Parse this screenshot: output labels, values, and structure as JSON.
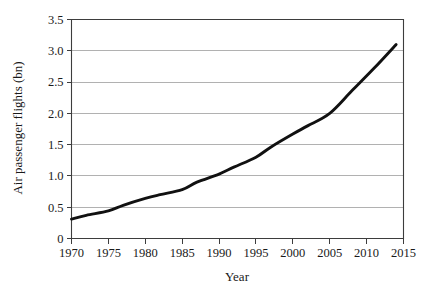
{
  "chart_data": {
    "type": "line",
    "title": "",
    "xlabel": "Year",
    "ylabel": "Air passenger flights (bn)",
    "xlim": [
      1970,
      2015
    ],
    "ylim": [
      0,
      3.5
    ],
    "grid": "horizontal",
    "legend": "none",
    "x_ticks": [
      "1970",
      "1975",
      "1980",
      "1985",
      "1990",
      "1995",
      "2000",
      "2005",
      "2010",
      "2015"
    ],
    "y_ticks": [
      "0",
      "0.5",
      "1.0",
      "1.5",
      "2.0",
      "2.5",
      "3.0",
      "3.5"
    ],
    "x_tick_values": [
      1970,
      1975,
      1980,
      1985,
      1990,
      1995,
      2000,
      2005,
      2010,
      2015
    ],
    "y_tick_values": [
      0,
      0.5,
      1.0,
      1.5,
      2.0,
      2.5,
      3.0,
      3.5
    ],
    "series": [
      {
        "name": "Air passenger flights",
        "color": "#111111",
        "x": [
          1970,
          1972,
          1975,
          1977,
          1980,
          1982,
          1985,
          1987,
          1990,
          1992,
          1995,
          1997,
          2000,
          2002,
          2005,
          2008,
          2011,
          2014
        ],
        "values": [
          0.31,
          0.37,
          0.44,
          0.53,
          0.64,
          0.7,
          0.78,
          0.9,
          1.03,
          1.14,
          1.3,
          1.46,
          1.67,
          1.8,
          2.0,
          2.36,
          2.72,
          3.1
        ]
      }
    ]
  },
  "figure": {
    "background_color": "#ffffff",
    "axis_color": "#3d3d3d",
    "grid_color": "#a8a8a8"
  }
}
